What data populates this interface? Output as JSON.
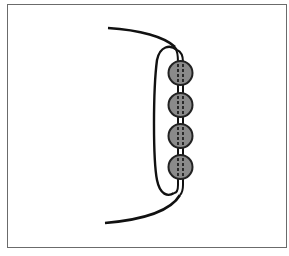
{
  "diagram": {
    "title": "",
    "colors": {
      "frame": "#6b6b6b",
      "cord": "#111111",
      "bead_fill": "#8a8a8a",
      "bead_stroke": "#222222"
    },
    "beads": [
      {
        "cx": 180.5,
        "cy": 73,
        "r": 12
      },
      {
        "cx": 180.5,
        "cy": 105,
        "r": 12
      },
      {
        "cx": 180.5,
        "cy": 136,
        "r": 12
      },
      {
        "cx": 180.5,
        "cy": 167,
        "r": 12
      }
    ]
  }
}
